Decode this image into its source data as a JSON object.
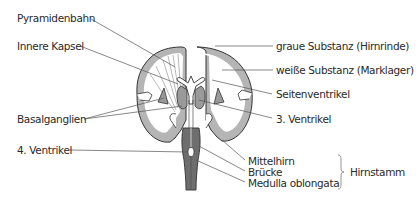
{
  "diagram": {
    "type": "brain-coronal-section",
    "labels": {
      "pyramidenbahn": "Pyramidenbahn",
      "innere_kapsel": "Innere Kapsel",
      "basalganglien": "Basalganglien",
      "vierter_ventrikel": "4. Ventrikel",
      "graue_substanz": "graue Substanz (Hirnrinde)",
      "weisse_substanz": "weiße Substanz (Marklager)",
      "seitenventrikel": "Seitenventrikel",
      "dritter_ventrikel": "3. Ventrikel",
      "mittelhirn": "Mittelhirn",
      "bruecke": "Brücke",
      "medulla": "Medulla oblongata",
      "hirnstamm": "Hirnstamm"
    },
    "colors": {
      "grey_matter": "#b5b5b5",
      "white_matter": "#ffffff",
      "brainstem": "#6e6e6e",
      "outline": "#333333",
      "leader_line": "#555555",
      "text": "#2a2a2a"
    }
  }
}
